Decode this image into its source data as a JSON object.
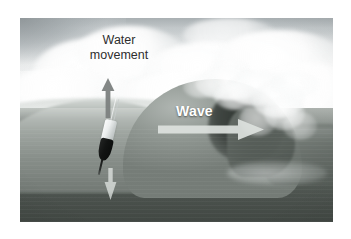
{
  "figure": {
    "background_color": "#ffffff",
    "photo": {
      "left": 20,
      "top": 18,
      "width": 313,
      "height": 204,
      "sky_color": "#f4f6f6",
      "cloud_color": "#ffffff",
      "sky_shadow_color": "#969da0",
      "ocean_color": "#6d746f",
      "ocean_deep_color": "#484f4a",
      "wave_body_color": "#7e857f",
      "wave_barrel_color": "#2c322e",
      "foam_color": "#ffffff"
    }
  },
  "annotations": {
    "water_movement": {
      "label": "Water\nmovement",
      "text_color": "#2e2e2e",
      "arrow_up": {
        "name": "water-movement-up-arrow",
        "direction": "up",
        "color": "#7c8180"
      },
      "arrow_down": {
        "name": "water-movement-down-arrow",
        "direction": "down",
        "color": "#e2e6e4"
      }
    },
    "wave": {
      "label": "Wave",
      "text_color": "#ffffff",
      "arrow_right": {
        "name": "wave-direction-arrow",
        "direction": "right",
        "color": "#d9dedb"
      }
    }
  },
  "objects": {
    "buoy": {
      "name": "buoy",
      "top_color": "#f2f4f4",
      "bottom_color": "#121413",
      "antenna_color": "#f0f2f2",
      "tilt_degrees": 13
    }
  }
}
